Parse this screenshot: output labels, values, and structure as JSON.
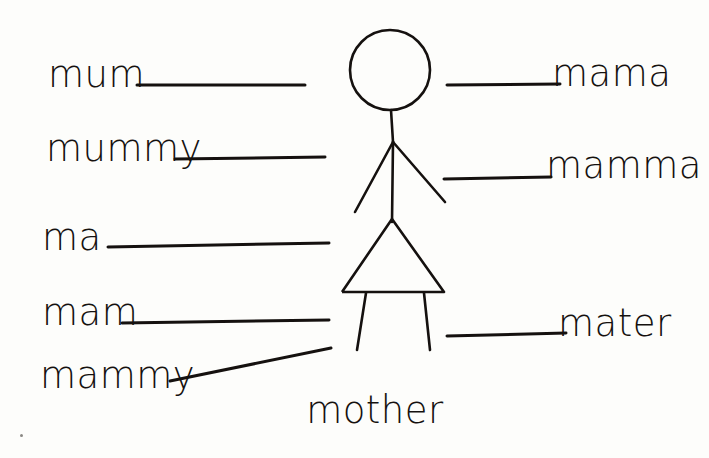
{
  "page": {
    "background_color": "#fdfdfb",
    "ink_color": "#15110f",
    "width": 709,
    "height": 458
  },
  "center_label": {
    "text": "mother",
    "x": 375,
    "y": 424
  },
  "left_entries": [
    {
      "text": "mum",
      "text_x": 48,
      "text_y": 86,
      "line_x1": 137,
      "line_y1": 85,
      "line_x2": 305,
      "line_y2": 85
    },
    {
      "text": "mummy",
      "text_x": 46,
      "text_y": 160,
      "line_x1": 175,
      "line_y1": 159,
      "line_x2": 325,
      "line_y2": 157
    },
    {
      "text": "ma",
      "text_x": 42,
      "text_y": 249,
      "line_x1": 108,
      "line_y1": 247,
      "line_x2": 329,
      "line_y2": 243
    },
    {
      "text": "mam",
      "text_x": 42,
      "text_y": 324,
      "line_x1": 122,
      "line_y1": 323,
      "line_x2": 329,
      "line_y2": 320
    },
    {
      "text": "mammy",
      "text_x": 40,
      "text_y": 387,
      "line_x1": 170,
      "line_y1": 381,
      "line_x2": 331,
      "line_y2": 348
    }
  ],
  "right_entries": [
    {
      "text": "mama",
      "text_x": 552,
      "text_y": 85,
      "line_x1": 447,
      "line_y1": 85,
      "line_x2": 560,
      "line_y2": 84
    },
    {
      "text": "mamma",
      "text_x": 546,
      "text_y": 177,
      "line_x1": 444,
      "line_y1": 179,
      "line_x2": 551,
      "line_y2": 177
    },
    {
      "text": "mater",
      "text_x": 558,
      "text_y": 335,
      "line_x1": 447,
      "line_y1": 336,
      "line_x2": 566,
      "line_y2": 333
    }
  ],
  "figure": {
    "name": "stick-figure-mother",
    "stroke_color": "#15110f",
    "stroke_width": 2.6,
    "head": {
      "cx": 390,
      "cy": 70,
      "r": 40
    },
    "neck": {
      "x1": 391,
      "y1": 110,
      "x2": 393,
      "y2": 142
    },
    "torso": {
      "x1": 393,
      "y1": 142,
      "x2": 392,
      "y2": 222
    },
    "arm_left": {
      "x1": 393,
      "y1": 142,
      "x2": 355,
      "y2": 212
    },
    "arm_right": {
      "x1": 393,
      "y1": 142,
      "x2": 445,
      "y2": 202
    },
    "skirt": {
      "apex_x": 392,
      "apex_y": 219,
      "base_left_x": 342,
      "base_left_y": 292,
      "base_right_x": 444,
      "base_right_y": 292
    },
    "leg_left": {
      "x1": 366,
      "y1": 293,
      "x2": 357,
      "y2": 350
    },
    "leg_right": {
      "x1": 424,
      "y1": 293,
      "x2": 430,
      "y2": 350
    }
  },
  "artifacts": [
    {
      "name": "scan-speck",
      "x": 20,
      "y": 434
    }
  ]
}
